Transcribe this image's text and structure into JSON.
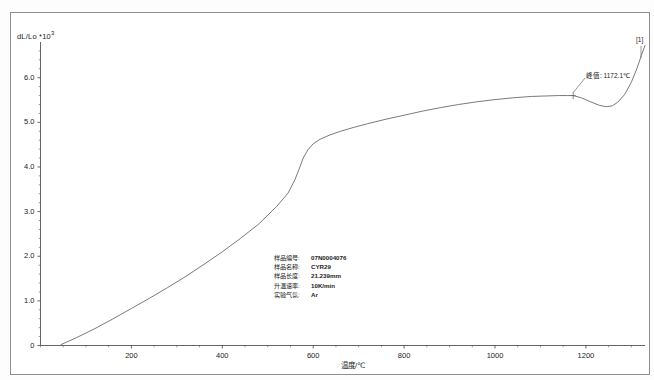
{
  "chart_data": {
    "type": "line",
    "title": "",
    "xlabel": "温度/℃",
    "ylabel": "dL/Lo *10",
    "ylabel_exponent": "3",
    "xlim": [
      0,
      1330
    ],
    "ylim": [
      0,
      6.8
    ],
    "xticks": [
      "200",
      "400",
      "600",
      "800",
      "1000",
      "1200"
    ],
    "xtick_values": [
      200,
      400,
      600,
      800,
      1000,
      1200
    ],
    "yticks": [
      "0",
      "1.0",
      "2.0",
      "3.0",
      "4.0",
      "5.0",
      "6.0"
    ],
    "ytick_values": [
      0,
      1.0,
      2.0,
      3.0,
      4.0,
      5.0,
      6.0
    ],
    "grid": false,
    "legend_position": "none",
    "series": [
      {
        "name": "[1]",
        "x": [
          45,
          80,
          120,
          160,
          200,
          240,
          280,
          320,
          360,
          400,
          440,
          480,
          520,
          545,
          560,
          570,
          578,
          588,
          600,
          615,
          635,
          660,
          690,
          720,
          760,
          800,
          840,
          880,
          920,
          960,
          1000,
          1040,
          1080,
          1110,
          1140,
          1160,
          1172.1,
          1190,
          1210,
          1230,
          1245,
          1258,
          1270,
          1285,
          1300,
          1312,
          1322,
          1330
        ],
        "y": [
          0.02,
          0.18,
          0.38,
          0.6,
          0.83,
          1.06,
          1.3,
          1.55,
          1.82,
          2.1,
          2.4,
          2.72,
          3.12,
          3.42,
          3.72,
          3.98,
          4.2,
          4.38,
          4.52,
          4.62,
          4.71,
          4.8,
          4.89,
          4.97,
          5.07,
          5.16,
          5.25,
          5.33,
          5.4,
          5.46,
          5.51,
          5.55,
          5.58,
          5.59,
          5.6,
          5.6,
          5.6,
          5.55,
          5.46,
          5.38,
          5.35,
          5.37,
          5.45,
          5.62,
          5.9,
          6.2,
          6.5,
          6.72
        ]
      }
    ],
    "annotations": [
      {
        "name": "peak-label",
        "text": "峰值: 1172.1℃",
        "x": 1172.1,
        "y": 5.6
      },
      {
        "name": "curve-index-label",
        "text": "[1]"
      }
    ]
  },
  "info_panel": {
    "rows": [
      {
        "key": "样品编号:",
        "value": "07N0004076"
      },
      {
        "key": "样品名称:",
        "value": "CYR29"
      },
      {
        "key": "样品长度:",
        "value": "21.239mm"
      },
      {
        "key": "升温速率:",
        "value": "10K/min"
      },
      {
        "key": "实验气氛:",
        "value": "Ar"
      }
    ]
  },
  "colors": {
    "curve": "#6b6b6b",
    "axis": "#555555",
    "frame": "#8e8e8e",
    "text": "#1b1b1b",
    "background": "#ffffff"
  }
}
